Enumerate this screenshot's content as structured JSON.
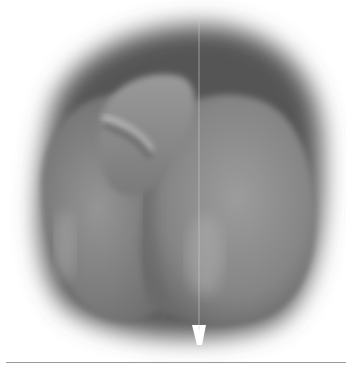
{
  "figure": {
    "palette": {
      "background": "#ffffff",
      "shadow": "#5a5a5a",
      "body": "#8a8a8a",
      "highlight": "#b4b4b4",
      "rule": "#9a9a9a"
    }
  }
}
